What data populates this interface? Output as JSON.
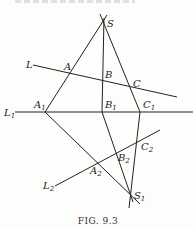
{
  "figure": {
    "caption": "FIG. 9.3",
    "line_color": "#222222",
    "points": {
      "S": {
        "label": "S",
        "x": 104,
        "y": 22
      },
      "S1": {
        "label": "S",
        "sub": "1",
        "x": 130,
        "y": 195
      },
      "A": {
        "label": "A",
        "x": 69,
        "y": 72
      },
      "B": {
        "label": "B",
        "x": 102,
        "y": 80
      },
      "C": {
        "label": "C",
        "x": 131,
        "y": 86
      },
      "A1": {
        "label": "A",
        "sub": "1",
        "x": 45,
        "y": 112
      },
      "B1": {
        "label": "B",
        "sub": "1",
        "x": 102,
        "y": 112
      },
      "C1": {
        "label": "C",
        "sub": "1",
        "x": 140,
        "y": 112
      },
      "A2": {
        "label": "A",
        "sub": "2",
        "x": 97,
        "y": 163
      },
      "B2": {
        "label": "B",
        "sub": "2",
        "x": 116,
        "y": 152
      },
      "C2": {
        "label": "C",
        "sub": "2",
        "x": 138,
        "y": 141
      }
    },
    "lines": {
      "L": {
        "label": "L",
        "sub": ""
      },
      "L1": {
        "label": "L",
        "sub": "1"
      },
      "L2": {
        "label": "L",
        "sub": "2"
      }
    }
  }
}
